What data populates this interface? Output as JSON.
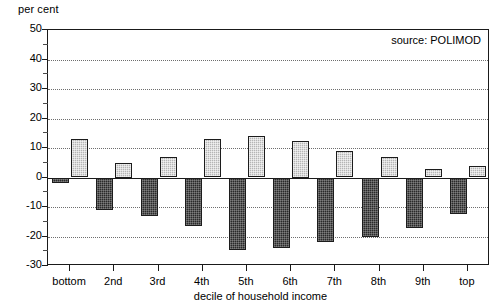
{
  "chart_data": {
    "type": "bar",
    "title": "",
    "subtitle": "",
    "ylabel": "per cent",
    "xlabel": "decile of household income",
    "categories": [
      "bottom",
      "2nd",
      "3rd",
      "4th",
      "5th",
      "6th",
      "7th",
      "8th",
      "9th",
      "top"
    ],
    "series": [
      {
        "name": "gain",
        "style": "light-hatched",
        "color": "#b5b5b5",
        "values": [
          13.0,
          5.0,
          7.0,
          13.0,
          14.0,
          12.5,
          9.0,
          7.0,
          3.0,
          4.0
        ]
      },
      {
        "name": "loss",
        "style": "dark-hatched",
        "color": "#2a2a2a",
        "values": [
          -2.0,
          -11.0,
          -13.0,
          -16.5,
          -24.5,
          -24.0,
          -22.0,
          -20.0,
          -17.0,
          -12.5
        ]
      }
    ],
    "ylim": [
      -30,
      50
    ],
    "y_ticks": [
      -30,
      -20,
      -10,
      0,
      10,
      20,
      30,
      40,
      50
    ],
    "y_tick_labels": [
      "-30",
      "-20",
      "-10",
      "0",
      "10",
      "20",
      "30",
      "40",
      "50"
    ],
    "y_minor_tick_step": 5,
    "grid": true,
    "grid_axis": "y",
    "grid_style": "dotted",
    "legend": "none",
    "annotations": [
      {
        "name": "source",
        "text": "source: POLIMOD",
        "position": "top-right"
      }
    ]
  },
  "axes": {
    "y_title": "per cent",
    "x_title": "decile of household income"
  },
  "note": {
    "source_text": "source: POLIMOD"
  },
  "colors": {
    "axis": "#1a1a1a",
    "grid": "#6e6e6e",
    "light_bar": "#b5b5b5",
    "dark_bar": "#2a2a2a",
    "background": "#ffffff"
  }
}
